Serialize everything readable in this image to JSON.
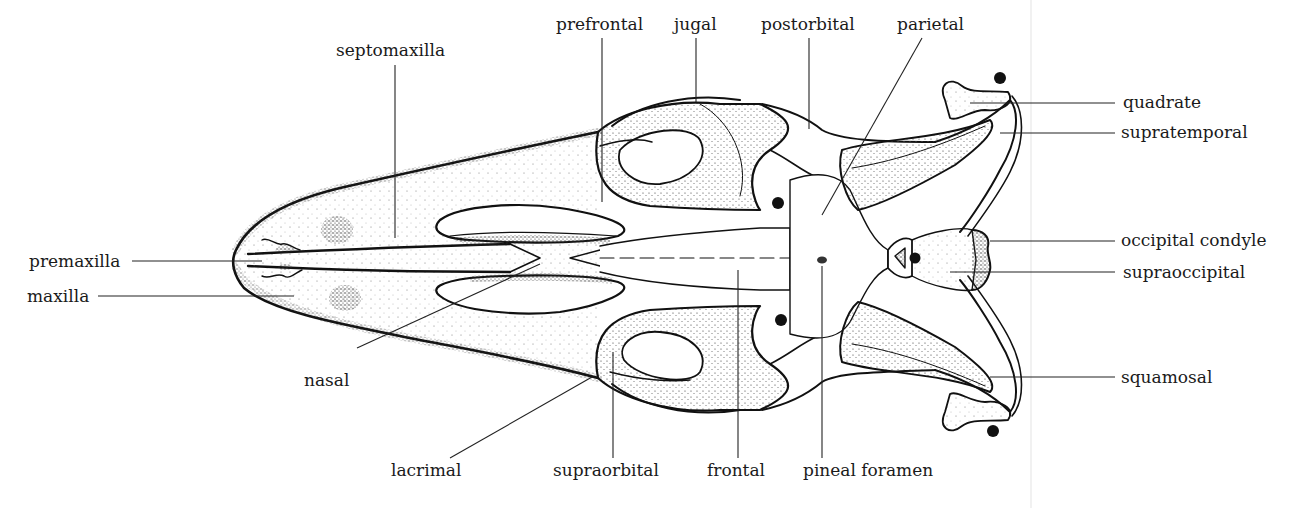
{
  "figure": {
    "background": "#ffffff",
    "ink": "#1a1a1a",
    "labels": {
      "septomaxilla": "septomaxilla",
      "prefrontal": "prefrontal",
      "jugal": "jugal",
      "postorbital": "postorbital",
      "parietal": "parietal",
      "quadrate": "quadrate",
      "supratemporal": "supratemporal",
      "occipital_condyle": "occipital condyle",
      "supraoccipital": "supraoccipital",
      "squamosal": "squamosal",
      "premaxilla": "premaxilla",
      "maxilla": "maxilla",
      "nasal": "nasal",
      "lacrimal": "lacrimal",
      "supraorbital": "supraorbital",
      "frontal": "frontal",
      "pineal_foramen": "pineal foramen"
    },
    "markers": [
      {
        "name": "dot-quadrate-top",
        "x": 1000,
        "y": 78
      },
      {
        "name": "dot-frontal-upper",
        "x": 778,
        "y": 203
      },
      {
        "name": "dot-frontal-lower",
        "x": 781,
        "y": 320
      },
      {
        "name": "dot-occipital",
        "x": 915,
        "y": 258
      },
      {
        "name": "dot-quadrate-bottom",
        "x": 993,
        "y": 431
      }
    ]
  }
}
